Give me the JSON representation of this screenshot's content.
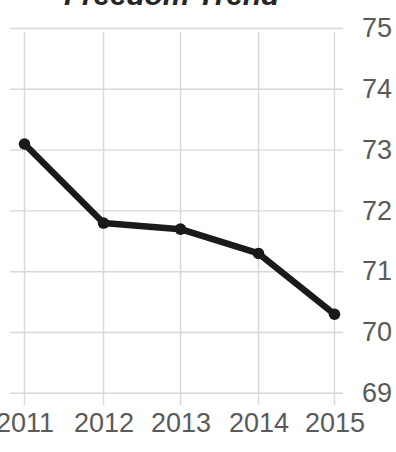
{
  "chart_data": {
    "type": "line",
    "title": "Freedom Trend",
    "xlabel": "",
    "ylabel": "",
    "categories": [
      "2011",
      "2012",
      "2013",
      "2014",
      "2015"
    ],
    "values": [
      73.1,
      71.8,
      71.7,
      71.3,
      70.3
    ],
    "series": [
      {
        "name": "Freedom Score",
        "values": [
          73.1,
          71.8,
          71.7,
          71.3,
          70.3
        ]
      }
    ],
    "x_tick_labels": [
      "2011",
      "2012",
      "2013",
      "2014",
      "2015"
    ],
    "y_tick_labels": [
      "75",
      "74",
      "73",
      "72",
      "71",
      "70",
      "69"
    ],
    "y_tick_values": [
      75,
      74,
      73,
      72,
      71,
      70,
      69
    ],
    "ylim": [
      69,
      75
    ],
    "grid": true,
    "y_axis_position": "right",
    "legend": "none",
    "marker": "circle",
    "line_color": "#1a1a1a",
    "marker_color": "#1a1a1a",
    "grid_color": "#d8d8d8",
    "tick_label_color": "#5a5a5a",
    "title_color": "#262626",
    "background_color": "#ffffff"
  }
}
